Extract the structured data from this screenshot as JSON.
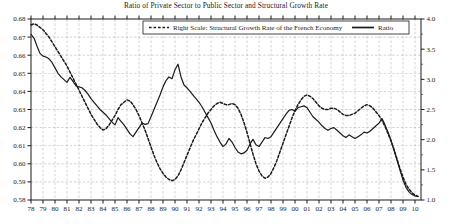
{
  "chart_data": {
    "type": "line",
    "title": "Ratio of Private Sector to Public Sector and Structural Growth Rate",
    "xlabel": "",
    "ylabel": "",
    "grid": true,
    "legend_position": "top-center",
    "x_tick_labels": [
      "78",
      "79",
      "80",
      "81",
      "82",
      "83",
      "84",
      "85",
      "86",
      "87",
      "88",
      "89",
      "90",
      "91",
      "92",
      "93",
      "94",
      "95",
      "96",
      "97",
      "98",
      "99",
      "00",
      "01",
      "02",
      "03",
      "04",
      "05",
      "06",
      "07",
      "08",
      "09",
      "10"
    ],
    "x_values": [
      1978,
      1979,
      1980,
      1981,
      1982,
      1983,
      1984,
      1985,
      1986,
      1987,
      1988,
      1989,
      1990,
      1991,
      1992,
      1993,
      1994,
      1995,
      1996,
      1997,
      1998,
      1999,
      2000,
      2001,
      2002,
      2003,
      2004,
      2005,
      2006,
      2007,
      2008,
      2009,
      2010
    ],
    "xlim": [
      1978,
      2010.5
    ],
    "left_axis": {
      "label": "Ratio",
      "lim": [
        0.58,
        0.68
      ],
      "ticks": [
        "0.58",
        "0.59",
        "0.60",
        "0.61",
        "0.62",
        "0.63",
        "0.64",
        "0.65",
        "0.66",
        "0.67",
        "0.68"
      ],
      "tick_values": [
        0.58,
        0.59,
        0.6,
        0.61,
        0.62,
        0.63,
        0.64,
        0.65,
        0.66,
        0.67,
        0.68
      ]
    },
    "right_axis": {
      "label": "Structural Growth Rate",
      "lim": [
        1.0,
        4.0
      ],
      "ticks": [
        "1.0",
        "1.5",
        "2.0",
        "2.5",
        "3.0",
        "3.5",
        "4.0"
      ],
      "tick_values": [
        1.0,
        1.5,
        2.0,
        2.5,
        3.0,
        3.5,
        4.0
      ]
    },
    "series": [
      {
        "name": "Ratio",
        "axis": "left",
        "style": "solid",
        "color": "#1a1a1a",
        "points": [
          [
            1978.0,
            0.6715
          ],
          [
            1978.25,
            0.6695
          ],
          [
            1978.5,
            0.665
          ],
          [
            1978.75,
            0.661
          ],
          [
            1979.0,
            0.6595
          ],
          [
            1979.25,
            0.659
          ],
          [
            1979.5,
            0.658
          ],
          [
            1979.75,
            0.656
          ],
          [
            1980.0,
            0.653
          ],
          [
            1980.25,
            0.65
          ],
          [
            1980.5,
            0.648
          ],
          [
            1980.75,
            0.6465
          ],
          [
            1981.0,
            0.645
          ],
          [
            1981.25,
            0.6478
          ],
          [
            1981.5,
            0.6455
          ],
          [
            1981.75,
            0.643
          ],
          [
            1982.0,
            0.6425
          ],
          [
            1982.25,
            0.642
          ],
          [
            1982.5,
            0.6405
          ],
          [
            1982.75,
            0.6385
          ],
          [
            1983.0,
            0.636
          ],
          [
            1983.25,
            0.634
          ],
          [
            1983.5,
            0.632
          ],
          [
            1983.75,
            0.63
          ],
          [
            1984.0,
            0.6285
          ],
          [
            1984.25,
            0.627
          ],
          [
            1984.5,
            0.625
          ],
          [
            1984.75,
            0.623
          ],
          [
            1985.0,
            0.6215
          ],
          [
            1985.25,
            0.6255
          ],
          [
            1985.5,
            0.6235
          ],
          [
            1985.75,
            0.6215
          ],
          [
            1986.0,
            0.619
          ],
          [
            1986.25,
            0.6165
          ],
          [
            1986.5,
            0.615
          ],
          [
            1986.75,
            0.6175
          ],
          [
            1987.0,
            0.62
          ],
          [
            1987.25,
            0.6225
          ],
          [
            1987.5,
            0.6218
          ],
          [
            1987.75,
            0.6222
          ],
          [
            1988.0,
            0.626
          ],
          [
            1988.25,
            0.63
          ],
          [
            1988.5,
            0.634
          ],
          [
            1988.75,
            0.638
          ],
          [
            1989.0,
            0.6425
          ],
          [
            1989.25,
            0.646
          ],
          [
            1989.5,
            0.648
          ],
          [
            1989.75,
            0.647
          ],
          [
            1990.0,
            0.652
          ],
          [
            1990.25,
            0.655
          ],
          [
            1990.5,
            0.648
          ],
          [
            1990.75,
            0.6435
          ],
          [
            1991.0,
            0.642
          ],
          [
            1991.25,
            0.64
          ],
          [
            1991.5,
            0.638
          ],
          [
            1991.75,
            0.636
          ],
          [
            1992.0,
            0.634
          ],
          [
            1992.25,
            0.6315
          ],
          [
            1992.5,
            0.6285
          ],
          [
            1992.75,
            0.6255
          ],
          [
            1993.0,
            0.6225
          ],
          [
            1993.25,
            0.6185
          ],
          [
            1993.5,
            0.615
          ],
          [
            1993.75,
            0.612
          ],
          [
            1994.0,
            0.6095
          ],
          [
            1994.25,
            0.611
          ],
          [
            1994.5,
            0.614
          ],
          [
            1994.75,
            0.612
          ],
          [
            1995.0,
            0.609
          ],
          [
            1995.25,
            0.6065
          ],
          [
            1995.5,
            0.6055
          ],
          [
            1995.75,
            0.606
          ],
          [
            1996.0,
            0.6075
          ],
          [
            1996.25,
            0.611
          ],
          [
            1996.5,
            0.6135
          ],
          [
            1996.75,
            0.6105
          ],
          [
            1997.0,
            0.6095
          ],
          [
            1997.25,
            0.612
          ],
          [
            1997.5,
            0.6145
          ],
          [
            1997.75,
            0.614
          ],
          [
            1998.0,
            0.615
          ],
          [
            1998.25,
            0.6175
          ],
          [
            1998.5,
            0.62
          ],
          [
            1998.75,
            0.6225
          ],
          [
            1999.0,
            0.625
          ],
          [
            1999.25,
            0.6275
          ],
          [
            1999.5,
            0.6295
          ],
          [
            1999.75,
            0.63
          ],
          [
            2000.0,
            0.629
          ],
          [
            2000.25,
            0.631
          ],
          [
            2000.5,
            0.6315
          ],
          [
            2000.75,
            0.632
          ],
          [
            2001.0,
            0.631
          ],
          [
            2001.25,
            0.6285
          ],
          [
            2001.5,
            0.626
          ],
          [
            2001.75,
            0.6245
          ],
          [
            2002.0,
            0.623
          ],
          [
            2002.25,
            0.621
          ],
          [
            2002.5,
            0.6195
          ],
          [
            2002.75,
            0.6185
          ],
          [
            2003.0,
            0.6195
          ],
          [
            2003.25,
            0.62
          ],
          [
            2003.5,
            0.6185
          ],
          [
            2003.75,
            0.617
          ],
          [
            2004.0,
            0.6155
          ],
          [
            2004.25,
            0.6145
          ],
          [
            2004.5,
            0.616
          ],
          [
            2004.75,
            0.615
          ],
          [
            2005.0,
            0.614
          ],
          [
            2005.25,
            0.615
          ],
          [
            2005.5,
            0.616
          ],
          [
            2005.75,
            0.6175
          ],
          [
            2006.0,
            0.617
          ],
          [
            2006.25,
            0.618
          ],
          [
            2006.5,
            0.6195
          ],
          [
            2006.75,
            0.621
          ],
          [
            2007.0,
            0.6225
          ],
          [
            2007.25,
            0.625
          ],
          [
            2007.5,
            0.6215
          ],
          [
            2007.75,
            0.6175
          ],
          [
            2008.0,
            0.613
          ],
          [
            2008.25,
            0.6075
          ],
          [
            2008.5,
            0.602
          ],
          [
            2008.75,
            0.5965
          ],
          [
            2009.0,
            0.591
          ],
          [
            2009.25,
            0.587
          ],
          [
            2009.5,
            0.5845
          ],
          [
            2009.75,
            0.583
          ],
          [
            2010.0,
            0.5822
          ],
          [
            2010.25,
            0.582
          ]
        ]
      },
      {
        "name": "Right Scale: Structural Growth Rate of the French Economy",
        "axis": "right",
        "style": "dashed",
        "color": "#1a1a1a",
        "points": [
          [
            1978.0,
            3.9
          ],
          [
            1978.25,
            3.92
          ],
          [
            1978.5,
            3.9
          ],
          [
            1978.75,
            3.86
          ],
          [
            1979.0,
            3.82
          ],
          [
            1979.25,
            3.76
          ],
          [
            1979.5,
            3.7
          ],
          [
            1979.75,
            3.62
          ],
          [
            1980.0,
            3.54
          ],
          [
            1980.25,
            3.46
          ],
          [
            1980.5,
            3.38
          ],
          [
            1980.75,
            3.3
          ],
          [
            1981.0,
            3.22
          ],
          [
            1981.25,
            3.12
          ],
          [
            1981.5,
            3.02
          ],
          [
            1981.75,
            2.92
          ],
          [
            1982.0,
            2.82
          ],
          [
            1982.25,
            2.72
          ],
          [
            1982.5,
            2.62
          ],
          [
            1982.75,
            2.52
          ],
          [
            1983.0,
            2.42
          ],
          [
            1983.25,
            2.34
          ],
          [
            1983.5,
            2.26
          ],
          [
            1983.75,
            2.2
          ],
          [
            1984.0,
            2.16
          ],
          [
            1984.25,
            2.18
          ],
          [
            1984.5,
            2.24
          ],
          [
            1984.75,
            2.32
          ],
          [
            1985.0,
            2.4
          ],
          [
            1985.25,
            2.5
          ],
          [
            1985.5,
            2.58
          ],
          [
            1985.75,
            2.62
          ],
          [
            1986.0,
            2.66
          ],
          [
            1986.25,
            2.64
          ],
          [
            1986.5,
            2.58
          ],
          [
            1986.75,
            2.5
          ],
          [
            1987.0,
            2.4
          ],
          [
            1987.25,
            2.28
          ],
          [
            1987.5,
            2.16
          ],
          [
            1987.75,
            2.02
          ],
          [
            1988.0,
            1.88
          ],
          [
            1988.25,
            1.74
          ],
          [
            1988.5,
            1.62
          ],
          [
            1988.75,
            1.52
          ],
          [
            1989.0,
            1.44
          ],
          [
            1989.25,
            1.38
          ],
          [
            1989.5,
            1.34
          ],
          [
            1989.75,
            1.32
          ],
          [
            1990.0,
            1.34
          ],
          [
            1990.25,
            1.4
          ],
          [
            1990.5,
            1.5
          ],
          [
            1990.75,
            1.62
          ],
          [
            1991.0,
            1.74
          ],
          [
            1991.25,
            1.86
          ],
          [
            1991.5,
            1.98
          ],
          [
            1991.75,
            2.08
          ],
          [
            1992.0,
            2.18
          ],
          [
            1992.25,
            2.28
          ],
          [
            1992.5,
            2.36
          ],
          [
            1992.75,
            2.44
          ],
          [
            1993.0,
            2.5
          ],
          [
            1993.25,
            2.56
          ],
          [
            1993.5,
            2.6
          ],
          [
            1993.75,
            2.62
          ],
          [
            1994.0,
            2.6
          ],
          [
            1994.25,
            2.58
          ],
          [
            1994.5,
            2.58
          ],
          [
            1994.75,
            2.6
          ],
          [
            1995.0,
            2.58
          ],
          [
            1995.25,
            2.52
          ],
          [
            1995.5,
            2.42
          ],
          [
            1995.75,
            2.28
          ],
          [
            1996.0,
            2.12
          ],
          [
            1996.25,
            1.94
          ],
          [
            1996.5,
            1.76
          ],
          [
            1996.75,
            1.6
          ],
          [
            1997.0,
            1.48
          ],
          [
            1997.25,
            1.4
          ],
          [
            1997.5,
            1.36
          ],
          [
            1997.75,
            1.38
          ],
          [
            1998.0,
            1.44
          ],
          [
            1998.25,
            1.54
          ],
          [
            1998.5,
            1.66
          ],
          [
            1998.75,
            1.8
          ],
          [
            1999.0,
            1.94
          ],
          [
            1999.25,
            2.08
          ],
          [
            1999.5,
            2.22
          ],
          [
            1999.75,
            2.36
          ],
          [
            2000.0,
            2.48
          ],
          [
            2000.25,
            2.58
          ],
          [
            2000.5,
            2.66
          ],
          [
            2000.75,
            2.72
          ],
          [
            2001.0,
            2.74
          ],
          [
            2001.25,
            2.72
          ],
          [
            2001.5,
            2.68
          ],
          [
            2001.75,
            2.62
          ],
          [
            2002.0,
            2.56
          ],
          [
            2002.25,
            2.52
          ],
          [
            2002.5,
            2.5
          ],
          [
            2002.75,
            2.5
          ],
          [
            2003.0,
            2.52
          ],
          [
            2003.25,
            2.52
          ],
          [
            2003.5,
            2.5
          ],
          [
            2003.75,
            2.46
          ],
          [
            2004.0,
            2.42
          ],
          [
            2004.25,
            2.4
          ],
          [
            2004.5,
            2.4
          ],
          [
            2004.75,
            2.42
          ],
          [
            2005.0,
            2.44
          ],
          [
            2005.25,
            2.48
          ],
          [
            2005.5,
            2.52
          ],
          [
            2005.75,
            2.56
          ],
          [
            2006.0,
            2.58
          ],
          [
            2006.25,
            2.56
          ],
          [
            2006.5,
            2.52
          ],
          [
            2006.75,
            2.46
          ],
          [
            2007.0,
            2.4
          ],
          [
            2007.25,
            2.32
          ],
          [
            2007.5,
            2.22
          ],
          [
            2007.75,
            2.1
          ],
          [
            2008.0,
            1.98
          ],
          [
            2008.25,
            1.84
          ],
          [
            2008.5,
            1.68
          ],
          [
            2008.75,
            1.52
          ],
          [
            2009.0,
            1.38
          ],
          [
            2009.25,
            1.26
          ],
          [
            2009.5,
            1.18
          ],
          [
            2009.75,
            1.12
          ],
          [
            2010.0,
            1.08
          ],
          [
            2010.25,
            1.06
          ]
        ]
      }
    ],
    "legend": [
      {
        "label": "Right Scale: Structural Growth Rate of the French Economy",
        "style": "dashed"
      },
      {
        "label": "Ratio",
        "style": "solid"
      }
    ]
  },
  "colors": {
    "line": "#1a1a1a",
    "grid": "#8a8a8a",
    "axis": "#1a1a1a",
    "background": "#ffffff"
  }
}
